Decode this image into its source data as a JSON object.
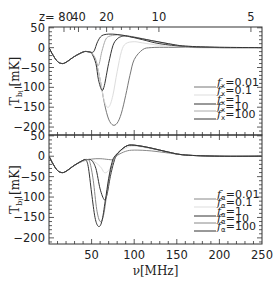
{
  "chart_data": [
    {
      "type": "line",
      "panel": "top",
      "xlabel": "",
      "ylabel": "T_b [mK]",
      "xlim": [
        0,
        250
      ],
      "ylim": [
        -220,
        52
      ],
      "yticks": [
        50,
        0,
        -50,
        -100,
        -150,
        -200
      ],
      "top_axis": {
        "label_prefix": "z=",
        "ticks": [
          {
            "z": "80",
            "nu": 17.6
          },
          {
            "z": "40",
            "nu": 34.6
          },
          {
            "z": "20",
            "nu": 67.6
          },
          {
            "z": "10",
            "nu": 129
          },
          {
            "z": "5",
            "nu": 237
          }
        ]
      },
      "legend": {
        "position": "lower right",
        "entries": [
          "f_x=0.01",
          "f_x=0.1",
          "f_x=1",
          "f_x=10",
          "f_x=100"
        ]
      },
      "series": [
        {
          "name": "f_x=0.01",
          "color": "#777777",
          "x": [
            0,
            5,
            10,
            15,
            20,
            30,
            40,
            45,
            50,
            55,
            60,
            65,
            70,
            75,
            80,
            85,
            90,
            95,
            100,
            110,
            120,
            140,
            160,
            180,
            250
          ],
          "y": [
            0,
            -20,
            -35,
            -40,
            -37,
            -22,
            -11,
            -10,
            -14,
            -35,
            -80,
            -140,
            -180,
            -195,
            -190,
            -165,
            -120,
            -70,
            -30,
            -5,
            0,
            1,
            1,
            0,
            0
          ]
        },
        {
          "name": "f_x=0.1",
          "color": "#dddddd",
          "x": [
            0,
            5,
            10,
            15,
            20,
            30,
            40,
            45,
            50,
            55,
            60,
            65,
            70,
            75,
            80,
            85,
            90,
            100,
            110,
            130,
            160,
            250
          ],
          "y": [
            0,
            -20,
            -35,
            -40,
            -37,
            -22,
            -11,
            -10,
            -14,
            -35,
            -80,
            -135,
            -150,
            -120,
            -60,
            -10,
            10,
            15,
            12,
            6,
            2,
            0
          ]
        },
        {
          "name": "f_x=1",
          "color": "#333333",
          "x": [
            0,
            5,
            10,
            15,
            20,
            30,
            40,
            45,
            50,
            55,
            58,
            62,
            65,
            70,
            75,
            80,
            85,
            90,
            100,
            110,
            130,
            160,
            200,
            250
          ],
          "y": [
            0,
            -20,
            -35,
            -40,
            -37,
            -22,
            -11,
            -10,
            -14,
            -40,
            -80,
            -107,
            -95,
            -40,
            5,
            22,
            28,
            29,
            25,
            20,
            10,
            3,
            0,
            0
          ]
        },
        {
          "name": "f_x=10",
          "color": "#aaaaaa",
          "x": [
            0,
            5,
            10,
            15,
            20,
            30,
            40,
            45,
            50,
            54,
            58,
            62,
            66,
            70,
            80,
            90,
            100,
            120,
            140,
            160,
            200,
            250
          ],
          "y": [
            0,
            -20,
            -35,
            -40,
            -37,
            -22,
            -11,
            -10,
            -14,
            -25,
            -45,
            -10,
            18,
            28,
            32,
            30,
            27,
            18,
            10,
            4,
            1,
            0
          ]
        },
        {
          "name": "f_x=100",
          "color": "#333333",
          "x": [
            0,
            5,
            10,
            15,
            20,
            30,
            40,
            45,
            50,
            53,
            57,
            62,
            70,
            80,
            90,
            100,
            120,
            140,
            160,
            200,
            250
          ],
          "y": [
            0,
            -20,
            -35,
            -40,
            -37,
            -22,
            -11,
            -10,
            -12,
            -8,
            15,
            30,
            34,
            33,
            30,
            26,
            18,
            10,
            4,
            1,
            0
          ]
        }
      ]
    },
    {
      "type": "line",
      "panel": "bottom",
      "xlabel": "ν[MHz]",
      "ylabel": "T_b [mK]",
      "xlim": [
        0,
        250
      ],
      "ylim": [
        -215,
        52
      ],
      "xticks": [
        50,
        100,
        150,
        200,
        250
      ],
      "yticks": [
        50,
        0,
        -50,
        -100,
        -150,
        -200
      ],
      "legend": {
        "position": "lower right",
        "entries": [
          "f_α=0.01",
          "f_α=0.1",
          "f_α=1",
          "f_α=10",
          "f_α=100"
        ]
      },
      "series": [
        {
          "name": "f_α=0.01",
          "color": "#888888",
          "x": [
            0,
            5,
            10,
            15,
            20,
            30,
            40,
            50,
            60,
            70,
            75,
            80,
            90,
            100,
            120,
            140,
            160,
            200,
            250
          ],
          "y": [
            0,
            -20,
            -35,
            -40,
            -37,
            -22,
            -12,
            -7,
            -6,
            -8,
            -8,
            2,
            12,
            15,
            13,
            8,
            3,
            0,
            0
          ]
        },
        {
          "name": "f_α=0.1",
          "color": "#dddddd",
          "x": [
            0,
            5,
            10,
            15,
            20,
            30,
            40,
            50,
            60,
            65,
            70,
            75,
            80,
            90,
            100,
            120,
            140,
            160,
            200,
            250
          ],
          "y": [
            0,
            -20,
            -35,
            -40,
            -37,
            -22,
            -12,
            -10,
            -25,
            -40,
            -35,
            -15,
            5,
            20,
            25,
            18,
            10,
            3,
            0,
            0
          ]
        },
        {
          "name": "f_α=1",
          "color": "#333333",
          "x": [
            0,
            5,
            10,
            15,
            20,
            30,
            40,
            45,
            50,
            55,
            60,
            65,
            68,
            72,
            76,
            80,
            90,
            100,
            120,
            140,
            160,
            200,
            250
          ],
          "y": [
            0,
            -20,
            -35,
            -40,
            -37,
            -22,
            -10,
            -8,
            -10,
            -30,
            -80,
            -107,
            -95,
            -50,
            -15,
            5,
            24,
            27,
            20,
            10,
            3,
            0,
            0
          ]
        },
        {
          "name": "f_α=10",
          "color": "#888888",
          "x": [
            0,
            5,
            10,
            15,
            20,
            30,
            40,
            45,
            48,
            52,
            56,
            60,
            64,
            68,
            72,
            76,
            80,
            90,
            100,
            120,
            140,
            160,
            200,
            250
          ],
          "y": [
            0,
            -20,
            -35,
            -40,
            -37,
            -22,
            -10,
            -8,
            -15,
            -60,
            -130,
            -160,
            -145,
            -90,
            -40,
            -10,
            5,
            24,
            27,
            20,
            10,
            3,
            0,
            0
          ]
        },
        {
          "name": "f_α=100",
          "color": "#333333",
          "x": [
            0,
            5,
            10,
            15,
            20,
            30,
            40,
            43,
            46,
            50,
            54,
            58,
            62,
            66,
            70,
            74,
            78,
            90,
            100,
            120,
            140,
            160,
            200,
            250
          ],
          "y": [
            0,
            -20,
            -35,
            -40,
            -37,
            -22,
            -10,
            -9,
            -25,
            -90,
            -150,
            -172,
            -160,
            -110,
            -55,
            -15,
            2,
            24,
            27,
            20,
            10,
            3,
            0,
            0
          ]
        }
      ]
    }
  ]
}
